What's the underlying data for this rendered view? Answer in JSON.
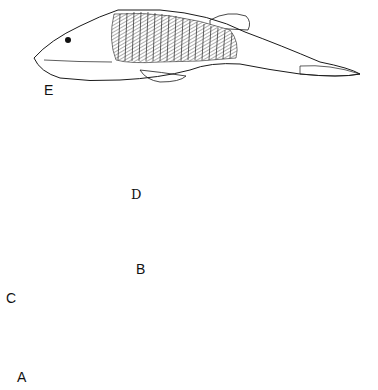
{
  "figure": {
    "ink_color": "#1a1a1a",
    "paper_color": "#ffffff",
    "specimens": [
      {
        "id": "E",
        "label": "E",
        "form": "armored fish, lateral view, head shield stippled, trunk with vertical scale rows"
      },
      {
        "id": "D",
        "label": "D",
        "form": "elongate fish, lateral view, tail reconstructed with dashed outline"
      },
      {
        "id": "C",
        "label": "C",
        "form": "head shield, dorsal view, polygonal plates anteriorly, stippled posteriorly"
      },
      {
        "id": "B",
        "label": "B",
        "form": "small slender fish, lateral view, with vertical scale rows"
      },
      {
        "id": "A",
        "label": "A",
        "form": "large fish, lateral view, finely hatched body, forked tail"
      }
    ]
  }
}
